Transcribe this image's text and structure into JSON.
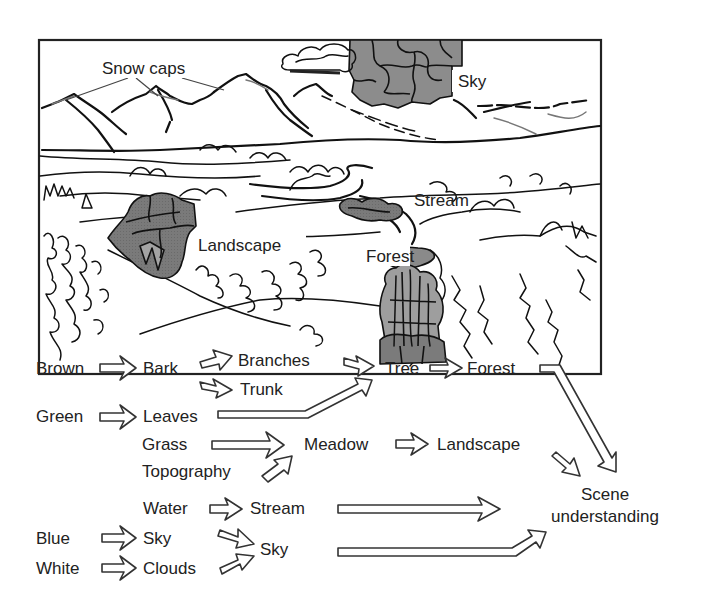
{
  "figure": {
    "colors": {
      "ink": "#111111",
      "text": "#222222",
      "segment_dark": "#6f6f6f",
      "segment_mid": "#8a8a8a",
      "segment_light": "#a8a8a8",
      "background": "#ffffff"
    }
  },
  "scene": {
    "labels": {
      "snow_caps": "Snow caps",
      "sky": "Sky",
      "stream": "Stream",
      "landscape": "Landscape",
      "forest": "Forest"
    }
  },
  "hierarchy": {
    "level0": {
      "brown": "Brown",
      "green": "Green",
      "blue": "Blue",
      "white": "White"
    },
    "level1": {
      "bark": "Bark",
      "leaves": "Leaves",
      "grass": "Grass",
      "topography": "Topography",
      "water": "Water",
      "sky": "Sky",
      "clouds": "Clouds"
    },
    "level2": {
      "branches": "Branches",
      "trunk": "Trunk",
      "meadow": "Meadow",
      "stream": "Stream",
      "sky": "Sky"
    },
    "level3": {
      "tree": "Tree",
      "landscape": "Landscape"
    },
    "level4": {
      "forest": "Forest"
    },
    "goal": {
      "line1": "Scene",
      "line2": "understanding"
    }
  }
}
